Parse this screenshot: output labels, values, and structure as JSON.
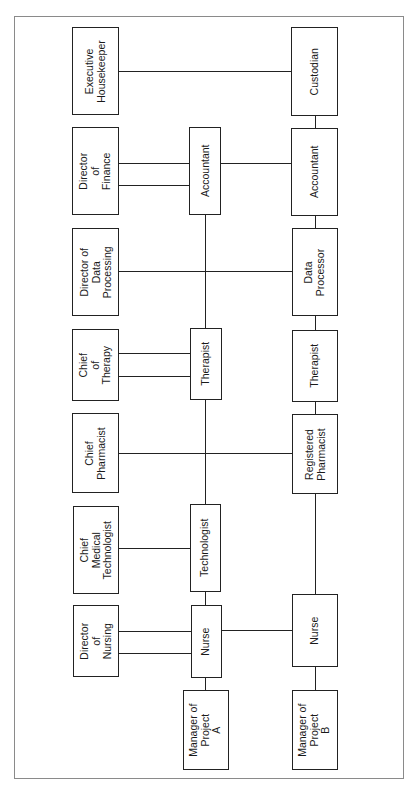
{
  "diagram": {
    "type": "organizational-chart",
    "orientation": "rotated-90-ccw",
    "columns": {
      "left": "department heads",
      "middle": "Project A staff",
      "right": "Project B staff"
    },
    "nodes": {
      "executive_housekeeper": "Executive\nHousekeeper",
      "director_finance": "Director\nof\nFinance",
      "director_data_processing": "Director of\nData\nProcessing",
      "chief_therapy": "Chief\nof\nTherapy",
      "chief_pharmacist": "Chief\nPharmacist",
      "chief_med_tech": "Chief\nMedical\nTechnologist",
      "director_nursing": "Director\nof\nNursing",
      "a_accountant": "Accountant",
      "a_therapist": "Therapist",
      "a_technologist": "Technologist",
      "a_nurse": "Nurse",
      "manager_a": "Manager of\nProject\nA",
      "b_custodian": "Custodian",
      "b_accountant": "Accountant",
      "b_data_processor": "Data\nProcessor",
      "b_therapist": "Therapist",
      "b_registered_pharmacist": "Registered\nPharmacist",
      "b_nurse": "Nurse",
      "manager_b": "Manager of\nProject\nB"
    },
    "edges": [
      [
        "executive_housekeeper",
        "b_custodian"
      ],
      [
        "director_finance",
        "a_accountant"
      ],
      [
        "director_finance",
        "a_accountant"
      ],
      [
        "a_accountant",
        "b_accountant"
      ],
      [
        "director_data_processing",
        "b_data_processor"
      ],
      [
        "chief_therapy",
        "a_therapist"
      ],
      [
        "chief_therapy",
        "a_therapist"
      ],
      [
        "chief_pharmacist",
        "b_registered_pharmacist"
      ],
      [
        "chief_med_tech",
        "a_technologist"
      ],
      [
        "director_nursing",
        "a_nurse"
      ],
      [
        "director_nursing",
        "a_nurse"
      ],
      [
        "a_nurse",
        "b_nurse"
      ],
      [
        "manager_a",
        "a_nurse"
      ],
      [
        "manager_b",
        "b_nurse"
      ]
    ]
  }
}
